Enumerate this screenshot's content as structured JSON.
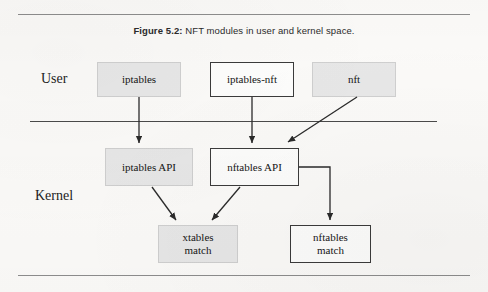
{
  "figure": {
    "caption_label": "Figure 5.2:",
    "caption_text": " NFT modules in user and kernel space.",
    "caption_full": "Figure 5.2: NFT modules in user and kernel space."
  },
  "zones": {
    "user_label": "User",
    "kernel_label": "Kernel"
  },
  "nodes": {
    "iptables": {
      "label": "iptables",
      "style": "filled"
    },
    "iptables_nft": {
      "label": "iptables-nft",
      "style": "outlined"
    },
    "nft": {
      "label": "nft",
      "style": "filled"
    },
    "iptables_api": {
      "label": "iptables API",
      "style": "filled"
    },
    "nftables_api": {
      "label": "nftables API",
      "style": "outlined"
    },
    "xtables_match": {
      "label": "xtables\nmatch",
      "style": "filled"
    },
    "nftables_match": {
      "label": "nftables\nmatch",
      "style": "outlined"
    }
  },
  "edges": [
    {
      "from": "iptables",
      "to": "iptables_api",
      "kind": "straight-down"
    },
    {
      "from": "iptables_nft",
      "to": "nftables_api",
      "kind": "straight-down"
    },
    {
      "from": "nft",
      "to": "nftables_api",
      "kind": "diagonal"
    },
    {
      "from": "iptables_api",
      "to": "xtables_match",
      "kind": "diagonal"
    },
    {
      "from": "nftables_api",
      "to": "xtables_match",
      "kind": "diagonal"
    },
    {
      "from": "nftables_api",
      "to": "nftables_match",
      "kind": "elbow"
    }
  ],
  "colors": {
    "page_background": "#fbfaf8",
    "node_fill_gray": "#e7e7e7",
    "node_border_dark": "#3b3b3b",
    "node_border_light": "#cfcfcf",
    "rule": "#8d8d8d",
    "divider": "#4a4a4a",
    "arrow": "#2a2a2a",
    "text": "#151515"
  }
}
